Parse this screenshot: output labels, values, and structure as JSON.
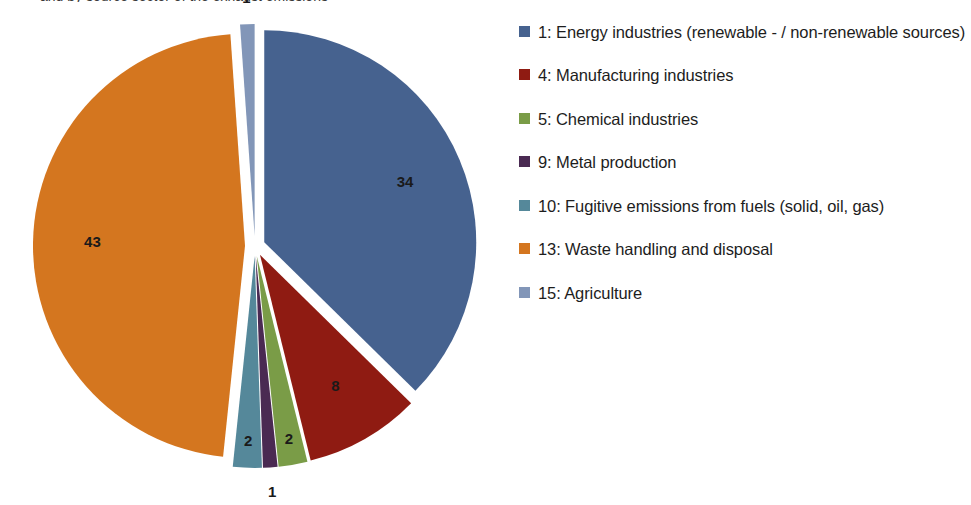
{
  "title": {
    "text": "and by source sector of the exhaust emissions"
  },
  "legend": {
    "position": "right",
    "items": [
      {
        "label": "1: Energy industries (renewable - / non-renewable sources)",
        "color": "#46628f",
        "key": "1"
      },
      {
        "label": "4: Manufacturing industries",
        "color": "#8f1b12",
        "key": "4"
      },
      {
        "label": "5: Chemical industries",
        "color": "#7a9c47",
        "key": "5"
      },
      {
        "label": "9: Metal production",
        "color": "#4a2a52",
        "key": "9"
      },
      {
        "label": "10: Fugitive emissions from fuels (solid, oil, gas)",
        "color": "#55889a",
        "key": "10"
      },
      {
        "label": "13: Waste handling and disposal",
        "color": "#d4761f",
        "key": "13"
      },
      {
        "label": "15: Agriculture",
        "color": "#8296b8",
        "key": "15"
      }
    ]
  },
  "chart_data": {
    "type": "pie",
    "title": "and by source sector of the exhaust emissions",
    "exploded": true,
    "start_angle_deg": 0,
    "direction": "clockwise",
    "total": 91,
    "labels": [
      "1: Energy industries (renewable - / non-renewable sources)",
      "4: Manufacturing industries",
      "5: Chemical industries",
      "9: Metal production",
      "10: Fugitive emissions from fuels (solid, oil, gas)",
      "13: Waste handling and disposal",
      "15: Agriculture"
    ],
    "short_labels": [
      "1",
      "4",
      "5",
      "9",
      "10",
      "13",
      "15"
    ],
    "values": [
      34,
      8,
      2,
      1,
      2,
      43,
      1
    ],
    "data_labels": [
      "34",
      "8",
      "2",
      "1",
      "2",
      "43",
      "1"
    ],
    "colors": [
      "#46628f",
      "#8f1b12",
      "#7a9c47",
      "#4a2a52",
      "#55889a",
      "#d4761f",
      "#8296b8"
    ],
    "slices": [
      {
        "name": "1: Energy industries (renewable - / non-renewable sources)",
        "value": 34,
        "label": "34",
        "color": "#46628f"
      },
      {
        "name": "4: Manufacturing industries",
        "value": 8,
        "label": "8",
        "color": "#8f1b12"
      },
      {
        "name": "5: Chemical industries",
        "value": 2,
        "label": "2",
        "color": "#7a9c47"
      },
      {
        "name": "9: Metal production",
        "value": 1,
        "label": "1",
        "color": "#4a2a52"
      },
      {
        "name": "10: Fugitive emissions from fuels (solid, oil, gas)",
        "value": 2,
        "label": "2",
        "color": "#55889a"
      },
      {
        "name": "13: Waste handling and disposal",
        "value": 43,
        "label": "43",
        "color": "#d4761f"
      },
      {
        "name": "15: Agriculture",
        "value": 1,
        "label": "1",
        "color": "#8296b8"
      }
    ]
  }
}
